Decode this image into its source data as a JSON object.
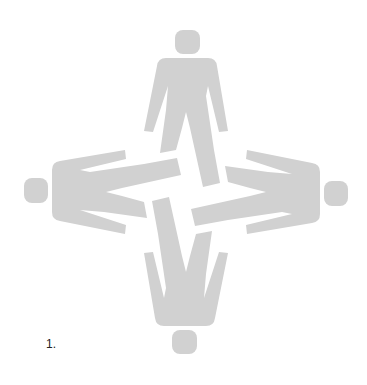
{
  "figure": {
    "caption": "1.",
    "fill_color": "#d1d1d1",
    "background_color": "#ffffff",
    "figures": [
      {
        "position": "top",
        "rotation": 0
      },
      {
        "position": "right",
        "rotation": 90
      },
      {
        "position": "bottom",
        "rotation": 180
      },
      {
        "position": "left",
        "rotation": 270
      }
    ]
  }
}
